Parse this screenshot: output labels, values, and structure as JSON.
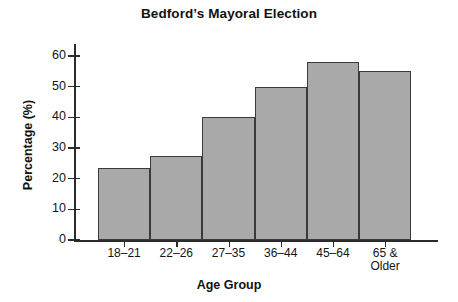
{
  "chart_data": {
    "type": "bar",
    "title": "Bedford’s Mayoral Election",
    "xlabel": "Age Group",
    "ylabel": "Percentage (%)",
    "categories": [
      "18–21",
      "22–26",
      "27–35",
      "36–44",
      "45–64",
      "65 &\nOlder"
    ],
    "values": [
      23.5,
      27.5,
      40,
      50,
      58,
      55
    ],
    "ylim": [
      0,
      60
    ],
    "yticks": [
      0,
      10,
      20,
      30,
      40,
      50,
      60
    ],
    "ytick_labels": [
      "0",
      "10",
      "20",
      "30",
      "40",
      "50",
      "60"
    ],
    "grid": false,
    "legend": false,
    "bar_color": "#a9a9a9",
    "bar_edge_color": "#3a3a3a",
    "axis_color": "#2b2b2b",
    "background": "#ffffff"
  }
}
